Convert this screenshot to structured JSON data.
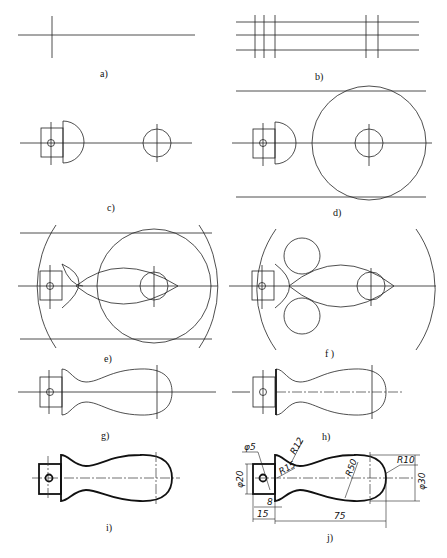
{
  "figure": {
    "panels": [
      {
        "id": "a",
        "caption": "a)"
      },
      {
        "id": "b",
        "caption": "b)"
      },
      {
        "id": "c",
        "caption": "c)"
      },
      {
        "id": "d",
        "caption": "d)"
      },
      {
        "id": "e",
        "caption": "e)"
      },
      {
        "id": "f",
        "caption": "f )"
      },
      {
        "id": "g",
        "caption": "g)"
      },
      {
        "id": "h",
        "caption": "h)"
      },
      {
        "id": "i",
        "caption": "i)"
      },
      {
        "id": "j",
        "caption": "j)"
      }
    ]
  },
  "dimensions": {
    "hole_dia": "φ5",
    "shank_dia": "φ20",
    "r12": "R12",
    "r15": "R15",
    "r50": "R50",
    "r10": "R10",
    "body_dia": "φ30",
    "shank_offset": "8",
    "shank_len": "15",
    "body_len": "75"
  }
}
